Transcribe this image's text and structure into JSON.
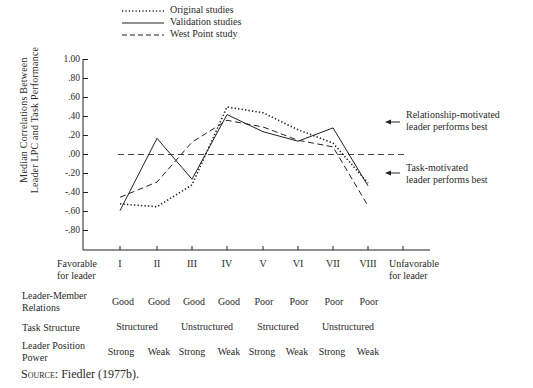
{
  "chart_data": {
    "type": "line",
    "title": "",
    "xlabel": "",
    "ylabel": "Median Correlations Between Leader LPC and Task Performance",
    "ylim": [
      -1.0,
      1.0
    ],
    "y_ticks": [
      "1.00",
      ".80",
      ".60",
      ".40",
      ".20",
      ".00",
      "-.20",
      "-.40",
      "-.60",
      "-.80"
    ],
    "categories": [
      "I",
      "II",
      "III",
      "IV",
      "V",
      "VI",
      "VII",
      "VIII"
    ],
    "x_end_labels": {
      "left": "Favorable for leader",
      "right": "Unfavorable for leader"
    },
    "legend_position": "top",
    "grid": false,
    "reference_line": {
      "y": 0.0,
      "style": "dashed"
    },
    "series": [
      {
        "name": "Original studies",
        "style": "dotted",
        "values": [
          -0.52,
          -0.55,
          -0.32,
          0.5,
          0.44,
          0.26,
          0.12,
          -0.3
        ]
      },
      {
        "name": "Validation studies",
        "style": "solid",
        "values": [
          -0.59,
          0.17,
          -0.26,
          0.42,
          0.24,
          0.14,
          0.28,
          -0.33
        ]
      },
      {
        "name": "West Point study",
        "style": "dashed",
        "values": [
          -0.45,
          -0.29,
          0.13,
          0.36,
          0.29,
          0.15,
          0.08,
          -0.54
        ]
      }
    ],
    "annotations": [
      {
        "text": "Relationship-motivated leader performs best",
        "arrow": "left",
        "position": "above zero"
      },
      {
        "text": "Task-motivated leader performs best",
        "arrow": "left",
        "position": "below zero"
      }
    ]
  },
  "legend": {
    "items": [
      {
        "label": "Original studies"
      },
      {
        "label": "Validation studies"
      },
      {
        "label": "West Point study"
      }
    ]
  },
  "axis": {
    "ylabel_line1": "Median Correlations Between",
    "ylabel_line2": "Leader LPC and Task Performance",
    "yticks": [
      "1.00",
      ".80",
      ".60",
      ".40",
      ".20",
      ".00",
      "-.20",
      "-.40",
      "-.60",
      "-.80"
    ],
    "xticks": [
      "I",
      "II",
      "III",
      "IV",
      "V",
      "VI",
      "VII",
      "VIII"
    ],
    "left_end_line1": "Favorable",
    "left_end_line2": "for leader",
    "right_end_line1": "Unfavorable",
    "right_end_line2": "for leader"
  },
  "annotations": {
    "relationship_line1": "Relationship-motivated",
    "relationship_line2": "leader performs best",
    "task_line1": "Task-motivated",
    "task_line2": "leader performs best"
  },
  "table": {
    "rows": [
      {
        "label_line1": "Leader-Member",
        "label_line2": "Relations",
        "cells": [
          "Good",
          "Good",
          "Good",
          "Good",
          "Poor",
          "Poor",
          "Poor",
          "Poor"
        ]
      },
      {
        "label_line1": "Task Structure",
        "label_line2": "",
        "groups": [
          "Structured",
          "Unstructured",
          "Structured",
          "Unstructured"
        ]
      },
      {
        "label_line1": "Leader Position",
        "label_line2": "Power",
        "cells": [
          "Strong",
          "Weak",
          "Strong",
          "Weak",
          "Strong",
          "Weak",
          "Strong",
          "Weak"
        ]
      }
    ]
  },
  "source": {
    "prefix": "Source:",
    "text": "Fiedler (1977b)."
  }
}
